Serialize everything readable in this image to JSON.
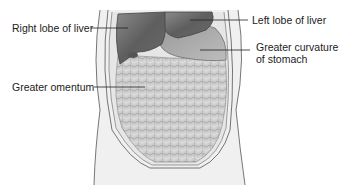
{
  "diagram": {
    "labels": {
      "right_lobe_of_liver": "Right lobe of liver",
      "left_lobe_of_liver": "Left lobe of liver",
      "greater_curvature_line1": "Greater curvature",
      "greater_curvature_line2": "of stomach",
      "greater_omentum": "Greater omentum"
    },
    "colors": {
      "liver": "#6e6e6e",
      "stomach": "#a8a8a8",
      "omentum": "#c8c8c8",
      "outline": "#555555",
      "skin": "#eeeeee",
      "leader_line": "#222222"
    }
  }
}
